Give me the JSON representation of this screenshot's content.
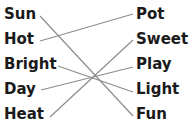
{
  "left_words": [
    {
      "label": "Sun",
      "x": 4,
      "y": 5
    },
    {
      "label": "Hot",
      "x": 4,
      "y": 29
    },
    {
      "label": "Bright",
      "x": 4,
      "y": 54
    },
    {
      "label": "Day",
      "x": 4,
      "y": 79
    },
    {
      "label": "Heat",
      "x": 4,
      "y": 104
    }
  ],
  "right_words": [
    {
      "label": "Pot",
      "x": 136,
      "y": 5
    },
    {
      "label": "Sweet",
      "x": 136,
      "y": 29
    },
    {
      "label": "Play",
      "x": 136,
      "y": 54
    },
    {
      "label": "Light",
      "x": 136,
      "y": 79
    },
    {
      "label": "Fun",
      "x": 136,
      "y": 104
    }
  ],
  "connections": [
    {
      "from": "Sun",
      "to": "Fun"
    },
    {
      "from": "Hot",
      "to": "Pot"
    },
    {
      "from": "Bright",
      "to": "Light"
    },
    {
      "from": "Day",
      "to": "Play"
    },
    {
      "from": "Heat",
      "to": "Sweet"
    }
  ],
  "line_color": "#8c8c8c"
}
